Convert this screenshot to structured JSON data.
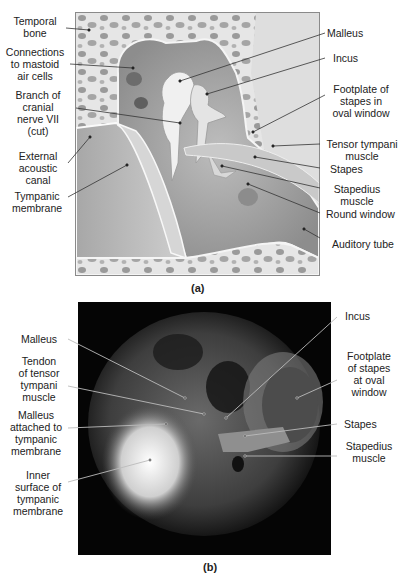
{
  "figure": {
    "panel_a": {
      "caption": "(a)",
      "left_labels": [
        {
          "text": "Temporal\nbone"
        },
        {
          "text": "Connections\nto mastoid\nair cells"
        },
        {
          "text": "Branch of\ncranial\nnerve VII\n(cut)"
        },
        {
          "text": "External\nacoustic\ncanal"
        },
        {
          "text": "Tympanic\nmembrane"
        }
      ],
      "right_labels": [
        {
          "text": "Malleus"
        },
        {
          "text": "Incus"
        },
        {
          "text": "Footplate of\nstapes in\noval window"
        },
        {
          "text": "Tensor tympani\nmuscle"
        },
        {
          "text": "Stapes"
        },
        {
          "text": "Stapedius\nmuscle"
        },
        {
          "text": "Round window"
        },
        {
          "text": "Auditory tube"
        }
      ]
    },
    "panel_b": {
      "caption": "(b)",
      "left_labels": [
        {
          "text": "Malleus"
        },
        {
          "text": "Tendon\nof tensor\ntympani\nmuscle"
        },
        {
          "text": "Malleus\nattached to\ntympanic\nmembrane"
        },
        {
          "text": "Inner\nsurface of\ntympanic\nmembrane"
        }
      ],
      "right_labels": [
        {
          "text": "Incus"
        },
        {
          "text": "Footplate\nof stapes\nat oval\nwindow"
        },
        {
          "text": "Stapes"
        },
        {
          "text": "Stapedius\nmuscle"
        }
      ]
    }
  }
}
